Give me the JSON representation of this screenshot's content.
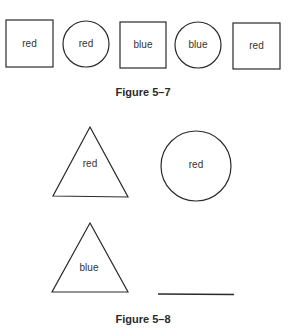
{
  "figure_5_7": {
    "caption": "Figure 5–7",
    "items": [
      {
        "shape": "square",
        "label": "red"
      },
      {
        "shape": "circle",
        "label": "red"
      },
      {
        "shape": "square",
        "label": "blue"
      },
      {
        "shape": "circle",
        "label": "blue"
      },
      {
        "shape": "square",
        "label": "red"
      }
    ]
  },
  "figure_5_8": {
    "caption": "Figure 5–8",
    "items": [
      {
        "shape": "triangle",
        "label": "red"
      },
      {
        "shape": "circle",
        "label": "red"
      },
      {
        "shape": "triangle",
        "label": "blue"
      },
      {
        "shape": "blank",
        "label": ""
      }
    ]
  },
  "colors": {
    "stroke": "#2a2a2a",
    "text": "#333333",
    "background": "#ffffff"
  }
}
